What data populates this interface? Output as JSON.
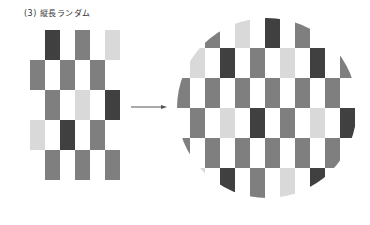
{
  "title": "(3) 縦長ランダム",
  "colors": {
    "dark": "#404040",
    "mid": "#7f7f7f",
    "light": "#d9d9d9"
  },
  "cell": {
    "width": 15,
    "height": 30
  },
  "left_pattern": {
    "origin": [
      30,
      30
    ],
    "cells": [
      {
        "col": 1,
        "row": 0,
        "tone": "dark"
      },
      {
        "col": 3,
        "row": 0,
        "tone": "mid"
      },
      {
        "col": 5,
        "row": 0,
        "tone": "light"
      },
      {
        "col": 0,
        "row": 1,
        "tone": "mid"
      },
      {
        "col": 2,
        "row": 1,
        "tone": "mid"
      },
      {
        "col": 4,
        "row": 1,
        "tone": "mid"
      },
      {
        "col": 1,
        "row": 2,
        "tone": "mid"
      },
      {
        "col": 3,
        "row": 2,
        "tone": "light"
      },
      {
        "col": 5,
        "row": 2,
        "tone": "dark"
      },
      {
        "col": 0,
        "row": 3,
        "tone": "light"
      },
      {
        "col": 2,
        "row": 3,
        "tone": "dark"
      },
      {
        "col": 4,
        "row": 3,
        "tone": "mid"
      },
      {
        "col": 1,
        "row": 4,
        "tone": "mid"
      },
      {
        "col": 3,
        "row": 4,
        "tone": "mid"
      },
      {
        "col": 5,
        "row": 4,
        "tone": "mid"
      }
    ]
  },
  "arrow": {
    "direction": "right",
    "color": "#555555"
  },
  "circle_pattern": {
    "origin": [
      175,
      18
    ],
    "circle": {
      "cx": 267,
      "cy": 108,
      "r": 90
    },
    "cells": [
      {
        "col": 2,
        "row": 0,
        "tone": "mid"
      },
      {
        "col": 4,
        "row": 0,
        "tone": "light"
      },
      {
        "col": 6,
        "row": 0,
        "tone": "dark"
      },
      {
        "col": 8,
        "row": 0,
        "tone": "mid"
      },
      {
        "col": 1,
        "row": 1,
        "tone": "light"
      },
      {
        "col": 3,
        "row": 1,
        "tone": "dark"
      },
      {
        "col": 5,
        "row": 1,
        "tone": "mid"
      },
      {
        "col": 7,
        "row": 1,
        "tone": "light"
      },
      {
        "col": 9,
        "row": 1,
        "tone": "dark"
      },
      {
        "col": 11,
        "row": 1,
        "tone": "mid"
      },
      {
        "col": 0,
        "row": 2,
        "tone": "mid"
      },
      {
        "col": 2,
        "row": 2,
        "tone": "mid"
      },
      {
        "col": 4,
        "row": 2,
        "tone": "mid"
      },
      {
        "col": 6,
        "row": 2,
        "tone": "mid"
      },
      {
        "col": 8,
        "row": 2,
        "tone": "mid"
      },
      {
        "col": 10,
        "row": 2,
        "tone": "mid"
      },
      {
        "col": 1,
        "row": 3,
        "tone": "mid"
      },
      {
        "col": 3,
        "row": 3,
        "tone": "light"
      },
      {
        "col": 5,
        "row": 3,
        "tone": "dark"
      },
      {
        "col": 7,
        "row": 3,
        "tone": "mid"
      },
      {
        "col": 9,
        "row": 3,
        "tone": "light"
      },
      {
        "col": 11,
        "row": 3,
        "tone": "dark"
      },
      {
        "col": 0,
        "row": 4,
        "tone": "mid"
      },
      {
        "col": 2,
        "row": 4,
        "tone": "mid"
      },
      {
        "col": 4,
        "row": 4,
        "tone": "mid"
      },
      {
        "col": 6,
        "row": 4,
        "tone": "mid"
      },
      {
        "col": 8,
        "row": 4,
        "tone": "mid"
      },
      {
        "col": 10,
        "row": 4,
        "tone": "mid"
      },
      {
        "col": 1,
        "row": 5,
        "tone": "light"
      },
      {
        "col": 3,
        "row": 5,
        "tone": "dark"
      },
      {
        "col": 5,
        "row": 5,
        "tone": "mid"
      },
      {
        "col": 7,
        "row": 5,
        "tone": "light"
      },
      {
        "col": 9,
        "row": 5,
        "tone": "dark"
      }
    ]
  }
}
